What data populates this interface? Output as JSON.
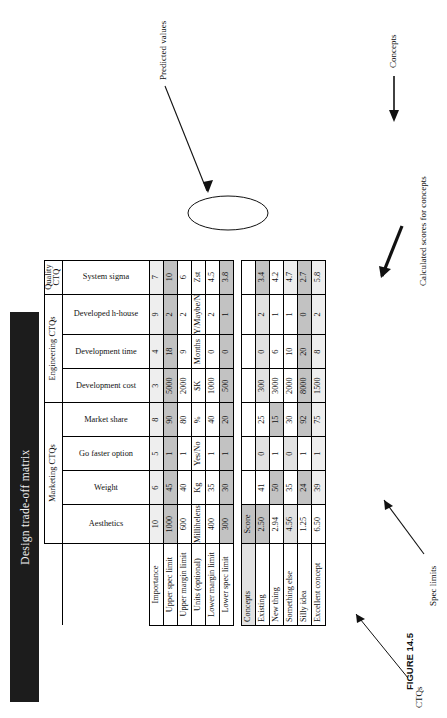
{
  "figure": {
    "caption": "FIGURE 14.5",
    "title": "Design trade-off matrix"
  },
  "annotations": {
    "ctqs": "CTQs",
    "spec_limits": "Spec limits",
    "calculated_scores": "Calculated scores for concepts",
    "concepts": "Concepts",
    "predicted_values": "Predicted values"
  },
  "column_groups": [
    {
      "label": "Marketing CTQs",
      "span": 4
    },
    {
      "label": "Engineering CTQs",
      "span": 3
    },
    {
      "label": "Quality CTQ",
      "span": 1
    }
  ],
  "ctq_columns": [
    "Aesthetics",
    "Weight",
    "Go faster option",
    "Market share",
    "Development cost",
    "Development time",
    "Developed h-house",
    "System sigma"
  ],
  "spec_rows": [
    {
      "label": "Importance",
      "values": [
        "10",
        "6",
        "5",
        "8",
        "3",
        "4",
        "9",
        "7"
      ]
    },
    {
      "label": "Upper spec limit",
      "values": [
        "1000",
        "45",
        "1",
        "90",
        "5000",
        "18",
        "2",
        "10"
      ]
    },
    {
      "label": "Upper margin limit",
      "values": [
        "600",
        "40",
        "1",
        "80",
        "2000",
        "9",
        "2",
        "6"
      ]
    },
    {
      "label": "Units (optional)",
      "values": [
        "Millihelens",
        "Kg",
        "Yes/No",
        "%",
        "$K",
        "Months",
        "Y/Maybe/N",
        "Zst"
      ]
    },
    {
      "label": "Lower margin limit",
      "values": [
        "400",
        "35",
        "1",
        "40",
        "1000",
        "0",
        "2",
        "4.5"
      ]
    },
    {
      "label": "Lower spec limit",
      "values": [
        "300",
        "30",
        "1",
        "20",
        "500",
        "0",
        "1",
        "3.8"
      ]
    }
  ],
  "concepts_header": {
    "label": "Concepts",
    "score_label": "Score"
  },
  "concept_rows": [
    {
      "name": "Existing",
      "score": "2.50",
      "values": [
        "250",
        "41",
        "0",
        "25",
        "300",
        "0",
        "2",
        "3.4"
      ]
    },
    {
      "name": "New thing",
      "score": "2.94",
      "values": [
        "350",
        "50",
        "1",
        "15",
        "3000",
        "6",
        "1",
        "4.2"
      ]
    },
    {
      "name": "Something else",
      "score": "4.56",
      "values": [
        "400",
        "35",
        "0",
        "30",
        "2000",
        "10",
        "1",
        "4.7"
      ]
    },
    {
      "name": "Silly idea",
      "score": "1.25",
      "values": [
        "900",
        "24",
        "1",
        "92",
        "8000",
        "20",
        "0",
        "2.7"
      ]
    },
    {
      "name": "Excellent concept",
      "score": "6.50",
      "values": [
        "550",
        "39",
        "1",
        "75",
        "1500",
        "8",
        "2",
        "5.8"
      ]
    }
  ],
  "colors": {
    "title_band": "#1c1c1c",
    "shade_dark": "#a8a8a8",
    "shade_mid": "#c2c2c2",
    "shade_light": "#e2e2e2"
  }
}
